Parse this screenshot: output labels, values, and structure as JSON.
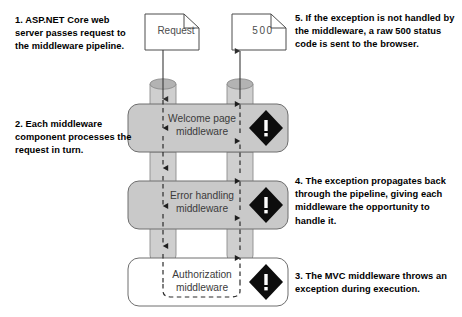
{
  "colors": {
    "middleware_fill": "#c9c9c9",
    "middleware_stroke": "#6e6e6e",
    "pipe_fill": "#cfcfcf",
    "pipe_stroke": "#8c8c8c",
    "pipe_top_fill": "#b3b3b3",
    "document_fill": "#ffffff",
    "document_stroke": "#4d4d4d",
    "arrow_solid": "#3a3a3a",
    "arrow_dashed": "#2b2b2b",
    "exception_diamond": "#0d0d0d",
    "exception_mark": "#ffffff",
    "callout_text": "#000000",
    "label_text": "#3b3b3b",
    "page_background": "#ffffff"
  },
  "callouts": [
    {
      "id": "callout-1",
      "number": "1.",
      "text": "1. ASP.NET Core web server passes request to the middleware pipeline."
    },
    {
      "id": "callout-2",
      "number": "2.",
      "text": "2. Each middleware component processes the request in turn."
    },
    {
      "id": "callout-3",
      "number": "3.",
      "text": "3. The MVC middleware throws an exception during execution."
    },
    {
      "id": "callout-4",
      "number": "4.",
      "text": "4. The exception propagates back through the pipeline, giving each middleware the opportunity to handle it."
    },
    {
      "id": "callout-5",
      "number": "5.",
      "text": "5. If the exception is not handled by the middleware, a raw 500 status code is sent to the browser."
    }
  ],
  "documents": [
    {
      "id": "request-document",
      "label": "Request"
    },
    {
      "id": "response-document",
      "label": "500"
    }
  ],
  "middleware": [
    {
      "id": "welcome-page-middleware",
      "line1": "Welcome page",
      "line2": "middleware",
      "filled": true,
      "has_exception_icon": true
    },
    {
      "id": "error-handling-middleware",
      "line1": "Error handling",
      "line2": "middleware",
      "filled": true,
      "has_exception_icon": true
    },
    {
      "id": "authorization-middleware",
      "line1": "Authorization",
      "line2": "middleware",
      "filled": false,
      "has_exception_icon": true
    }
  ],
  "icons": {
    "exception": "exception-diamond-icon",
    "request_flow": "down-arrow-icon",
    "response_flow": "up-arrow-icon"
  },
  "flows": {
    "request_label": "request travels down the pipeline",
    "response_label": "exception propagates back up the pipeline"
  }
}
